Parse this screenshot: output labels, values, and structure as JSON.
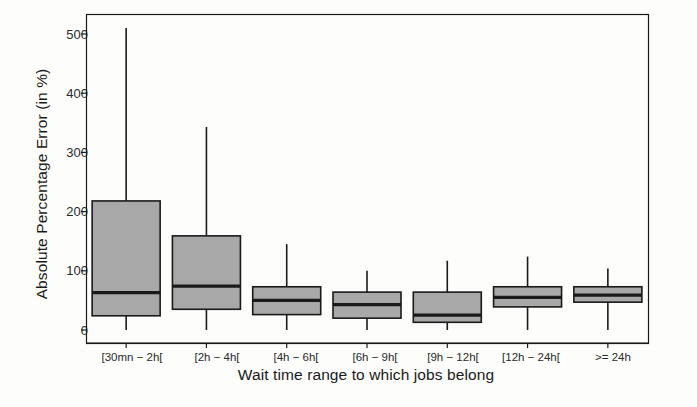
{
  "chart_data": {
    "type": "box",
    "title": "",
    "xlabel": "Wait time range to which jobs belong",
    "ylabel": "Absolute Percentage Error (in %)",
    "categories": [
      "[30mn − 2h[",
      "[2h − 4h[",
      "[4h − 6h[",
      "[6h − 9h[",
      "[9h − 12h[",
      "[12h − 24h[",
      ">= 24h"
    ],
    "ylim": [
      -25,
      545
    ],
    "yticks": [
      0,
      100,
      200,
      300,
      400,
      500
    ],
    "ytick_labels": [
      "0",
      "100",
      "200",
      "300",
      "400",
      "500"
    ],
    "grid": false,
    "legend": null,
    "box_fill": "#a8a8a8",
    "box_edge": "#1a1a1a",
    "boxes": [
      {
        "category": "[30mn − 2h[",
        "whisker_low": 0,
        "q1": 24,
        "median": 63,
        "q3": 218,
        "whisker_high": 510
      },
      {
        "category": "[2h − 4h[",
        "whisker_low": 0,
        "q1": 35,
        "median": 74,
        "q3": 159,
        "whisker_high": 343
      },
      {
        "category": "[4h − 6h[",
        "whisker_low": 0,
        "q1": 26,
        "median": 50,
        "q3": 73,
        "whisker_high": 145
      },
      {
        "category": "[6h − 9h[",
        "whisker_low": 0,
        "q1": 20,
        "median": 43,
        "q3": 64,
        "whisker_high": 100
      },
      {
        "category": "[9h − 12h[",
        "whisker_low": 0,
        "q1": 13,
        "median": 25,
        "q3": 64,
        "whisker_high": 117
      },
      {
        "category": "[12h − 24h[",
        "whisker_low": 0,
        "q1": 39,
        "median": 55,
        "q3": 73,
        "whisker_high": 124
      },
      {
        "category": ">= 24h",
        "whisker_low": 0,
        "q1": 47,
        "median": 59,
        "q3": 73,
        "whisker_high": 104
      }
    ]
  },
  "axes": {
    "y_title": "Absolute Percentage Error (in %)",
    "x_title": "Wait time range to which jobs belong",
    "ytick_labels": [
      "500",
      "400",
      "300",
      "200",
      "100",
      "0"
    ],
    "xtick_labels": [
      "[30mn − 2h[",
      "[2h − 4h[",
      "[4h − 6h[",
      "[6h − 9h[",
      "[9h − 12h[",
      "[12h − 24h[",
      ">= 24h"
    ]
  }
}
